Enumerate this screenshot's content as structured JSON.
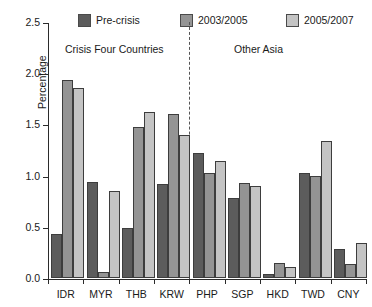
{
  "chart_data": {
    "type": "bar",
    "title": "",
    "xlabel": "",
    "ylabel": "Percentage",
    "ylim": [
      0.0,
      2.5
    ],
    "ytick_labels": [
      "0.0",
      "0.5",
      "1.0",
      "1.5",
      "2.0",
      "2.5"
    ],
    "ytick_values": [
      0.0,
      0.5,
      1.0,
      1.5,
      2.0,
      2.5
    ],
    "grid": false,
    "legend_position": "top",
    "categories": [
      "IDR",
      "MYR",
      "THB",
      "KRW",
      "PHP",
      "SGP",
      "HKD",
      "TWD",
      "CNY"
    ],
    "series": [
      {
        "name": "Pre-crisis",
        "color": "#5c5c5c",
        "values": [
          0.43,
          0.94,
          0.49,
          0.92,
          1.22,
          0.78,
          0.04,
          1.03,
          0.28
        ]
      },
      {
        "name": "2003/2005",
        "color": "#949494",
        "values": [
          1.93,
          0.06,
          1.47,
          1.6,
          1.03,
          0.93,
          0.15,
          1.0,
          0.14
        ]
      },
      {
        "name": "2005/2007",
        "color": "#c4c4c4",
        "values": [
          1.86,
          0.85,
          1.62,
          1.4,
          1.14,
          0.9,
          0.11,
          1.34,
          0.34
        ]
      }
    ],
    "annotations": [
      {
        "text": "Crisis Four Countries",
        "covers": [
          "IDR",
          "MYR",
          "THB",
          "KRW"
        ]
      },
      {
        "text": "Other Asia",
        "covers": [
          "PHP",
          "SGP",
          "HKD",
          "TWD",
          "CNY"
        ]
      }
    ],
    "divider": {
      "after_category": "KRW",
      "style": "dotted"
    }
  }
}
